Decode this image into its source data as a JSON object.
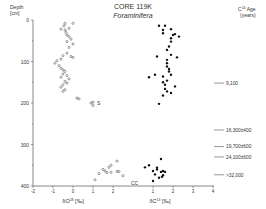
{
  "chart_data": {
    "type": "scatter",
    "title": "CORE 119K",
    "subtitle": "Foraminifera",
    "ylabel": "Depth [cm]",
    "ylim": [
      0,
      400
    ],
    "y_ticks": [
      0,
      100,
      200,
      300,
      400
    ],
    "y_tick_labels": [
      "0",
      "100",
      "200",
      "300",
      "400"
    ],
    "grid": false,
    "axes": [
      {
        "name": "oxygen",
        "xlabel": "δO18 [‰]",
        "x_ticks": [
          -2,
          -1,
          0,
          1,
          2
        ],
        "x_tick_labels": [
          "-2",
          "-1",
          "0",
          "1",
          "2"
        ]
      },
      {
        "name": "carbon",
        "xlabel": "δC13 [‰]",
        "x_ticks": [
          1,
          2,
          3,
          4
        ],
        "x_tick_labels": [
          "1",
          "2",
          "3",
          "4"
        ]
      }
    ],
    "series": [
      {
        "name": "δO18",
        "marker": "open-circle",
        "points": [
          [
            -0.4,
            8
          ],
          [
            0.0,
            8
          ],
          [
            -0.45,
            14
          ],
          [
            -0.6,
            22
          ],
          [
            -0.4,
            24
          ],
          [
            -0.2,
            20
          ],
          [
            -0.35,
            30
          ],
          [
            -0.3,
            36
          ],
          [
            -0.2,
            40
          ],
          [
            -0.1,
            46
          ],
          [
            -0.3,
            52
          ],
          [
            0.0,
            58
          ],
          [
            -0.2,
            66
          ],
          [
            -0.3,
            80
          ],
          [
            -0.1,
            88
          ],
          [
            0.0,
            90
          ],
          [
            -0.5,
            86
          ],
          [
            -0.6,
            94
          ],
          [
            -0.8,
            98
          ],
          [
            -0.9,
            104
          ],
          [
            -0.7,
            110
          ],
          [
            -0.6,
            116
          ],
          [
            -0.5,
            120
          ],
          [
            -0.4,
            124
          ],
          [
            -0.5,
            130
          ],
          [
            -0.3,
            134
          ],
          [
            -0.6,
            138
          ],
          [
            -0.2,
            142
          ],
          [
            -0.4,
            148
          ],
          [
            -0.3,
            152
          ],
          [
            -0.5,
            156
          ],
          [
            -0.6,
            162
          ],
          [
            -0.4,
            168
          ],
          [
            -0.5,
            172
          ],
          [
            0.2,
            188
          ],
          [
            0.3,
            190
          ],
          [
            0.9,
            200
          ],
          [
            1.0,
            198
          ],
          [
            1.0,
            206
          ],
          [
            1.1,
            385
          ],
          [
            1.3,
            370
          ],
          [
            1.5,
            360
          ],
          [
            1.6,
            364
          ],
          [
            1.8,
            355
          ],
          [
            1.9,
            350
          ],
          [
            2.2,
            340
          ],
          [
            1.7,
            368
          ],
          [
            1.9,
            367
          ],
          [
            2.2,
            365
          ],
          [
            2.3,
            365
          ],
          [
            2.5,
            375
          ]
        ]
      },
      {
        "name": "δC13",
        "marker": "filled-circle",
        "points": [
          [
            1.3,
            14
          ],
          [
            1.6,
            14
          ],
          [
            1.5,
            24
          ],
          [
            1.9,
            22
          ],
          [
            1.5,
            32
          ],
          [
            2.1,
            34
          ],
          [
            2.0,
            36
          ],
          [
            2.3,
            40
          ],
          [
            1.9,
            44
          ],
          [
            1.9,
            52
          ],
          [
            1.8,
            64
          ],
          [
            1.7,
            72
          ],
          [
            1.2,
            88
          ],
          [
            1.9,
            84
          ],
          [
            2.2,
            90
          ],
          [
            1.7,
            96
          ],
          [
            1.7,
            104
          ],
          [
            1.7,
            112
          ],
          [
            1.8,
            118
          ],
          [
            1.8,
            124
          ],
          [
            1.9,
            132
          ],
          [
            0.8,
            138
          ],
          [
            1.1,
            132
          ],
          [
            1.5,
            136
          ],
          [
            1.7,
            146
          ],
          [
            1.5,
            150
          ],
          [
            1.6,
            156
          ],
          [
            2.1,
            160
          ],
          [
            1.6,
            166
          ],
          [
            1.7,
            172
          ],
          [
            1.9,
            176
          ],
          [
            1.5,
            182
          ],
          [
            1.3,
            202
          ],
          [
            1.4,
            335
          ],
          [
            0.6,
            355
          ],
          [
            0.8,
            350
          ],
          [
            1.0,
            364
          ],
          [
            1.2,
            360
          ],
          [
            1.2,
            356
          ],
          [
            1.1,
            372
          ],
          [
            1.3,
            380
          ],
          [
            1.4,
            366
          ],
          [
            1.5,
            364
          ],
          [
            1.6,
            366
          ],
          [
            1.5,
            374
          ],
          [
            1.0,
            388
          ],
          [
            1.45,
            378
          ]
        ]
      }
    ],
    "age_header": "C14 Age (years)",
    "age_annotations": [
      {
        "depth": 152,
        "label": "9,100"
      },
      {
        "depth": 265,
        "label": "16,300±400"
      },
      {
        "depth": 305,
        "label": "19,700±600"
      },
      {
        "depth": 330,
        "label": "24,100±600"
      },
      {
        "depth": 373,
        "label": ">32,000"
      }
    ],
    "misc_markers": [
      {
        "label": "S",
        "x_axis": "oxygen",
        "x": 1.2,
        "depth": 200
      },
      {
        "label": "CC",
        "x_axis": "oxygen",
        "x": 2.9,
        "depth": 392
      }
    ]
  }
}
